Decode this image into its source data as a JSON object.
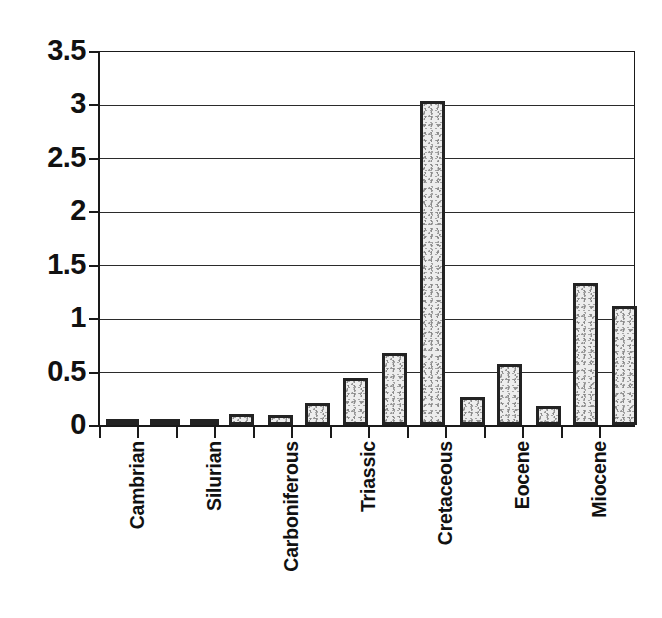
{
  "chart_data": {
    "type": "bar",
    "title": "",
    "subtitle": "",
    "xlabel": "",
    "ylabel": "",
    "ylim": [
      0,
      3.5
    ],
    "ytick_labels": [
      "0",
      "0.5",
      "1",
      "1.5",
      "2",
      "2.5",
      "3",
      "3.5"
    ],
    "ytick_values": [
      0,
      0.5,
      1,
      1.5,
      2,
      2.5,
      3,
      3.5
    ],
    "grid": true,
    "legend": false,
    "legend_position": "none",
    "bar_count": 14,
    "categories": [
      "Cambrian",
      "",
      "Silurian",
      "",
      "Carboniferous",
      "",
      "Triassic",
      "",
      "Cretaceous",
      "",
      "Eocene",
      "",
      "Miocene",
      ""
    ],
    "tick_labels": [
      "Cambrian",
      "Silurian",
      "Carboniferous",
      "Triassic",
      "Cretaceous",
      "Eocene",
      "Miocene"
    ],
    "values": [
      0.05,
      0.015,
      0.04,
      0.1,
      0.09,
      0.21,
      0.44,
      0.68,
      3.04,
      0.26,
      0.57,
      0.18,
      1.33,
      1.12
    ],
    "colors": {
      "bar_border": "#232323",
      "bar_fill": "#ededed",
      "axis": "#1a1a1a",
      "gridline": "#2b2b2b",
      "text": "#111111",
      "background": "#ffffff"
    }
  }
}
